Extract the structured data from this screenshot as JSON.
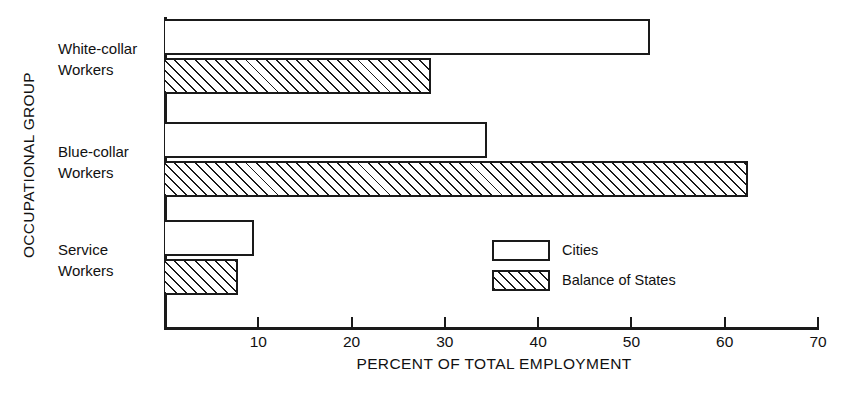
{
  "chart_data": {
    "type": "bar",
    "orientation": "horizontal",
    "title": "",
    "xlabel": "PERCENT OF TOTAL EMPLOYMENT",
    "ylabel": "OCCUPATIONAL GROUP",
    "categories": [
      "White-collar\nWorkers",
      "Blue-collar\nWorkers",
      "Service\nWorkers"
    ],
    "series": [
      {
        "name": "Cities",
        "pattern": "open",
        "values": [
          52.0,
          34.5,
          9.5
        ]
      },
      {
        "name": "Balance of States",
        "pattern": "hatched",
        "values": [
          28.5,
          62.5,
          7.8
        ]
      }
    ],
    "xlim": [
      0,
      70
    ],
    "xticks": [
      10,
      20,
      30,
      40,
      50,
      60,
      70
    ],
    "xtick_labels": [
      "10",
      "20",
      "30",
      "40",
      "50",
      "60",
      "70"
    ],
    "grid": false,
    "legend_position": "inside-center-bottom",
    "colors": {
      "line": "#1a1a1a",
      "fill": "#ffffff",
      "background": "#ffffff"
    }
  },
  "axes": {
    "ylabel": "OCCUPATIONAL GROUP",
    "xlabel": "PERCENT OF TOTAL EMPLOYMENT",
    "ticks": [
      {
        "value": "10"
      },
      {
        "value": "20"
      },
      {
        "value": "30"
      },
      {
        "value": "40"
      },
      {
        "value": "50"
      },
      {
        "value": "60"
      },
      {
        "value": "70"
      }
    ]
  },
  "categories": [
    {
      "label": "White-collar\nWorkers"
    },
    {
      "label": "Blue-collar\nWorkers"
    },
    {
      "label": "Service\nWorkers"
    }
  ],
  "legend": {
    "items": [
      {
        "label": "Cities"
      },
      {
        "label": "Balance of States"
      }
    ]
  }
}
